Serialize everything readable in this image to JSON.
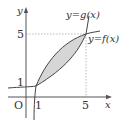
{
  "diagram": {
    "type": "function-graph",
    "axes": {
      "x_label": "x",
      "y_label": "y",
      "origin_label": "O"
    },
    "ticks": {
      "x": [
        "1",
        "5"
      ],
      "y": [
        "1",
        "5"
      ]
    },
    "curves": [
      {
        "name": "f",
        "label": "y=f(x)"
      },
      {
        "name": "g",
        "label": "y=g(x)"
      }
    ],
    "intersections": [
      {
        "x": 1,
        "y": 1
      },
      {
        "x": 5,
        "y": 5
      }
    ],
    "shaded_region": "between f and g from x=1 to x=5",
    "colors": {
      "line": "#444444",
      "shade": "#d4d4d4",
      "dashed": "#999999"
    }
  }
}
